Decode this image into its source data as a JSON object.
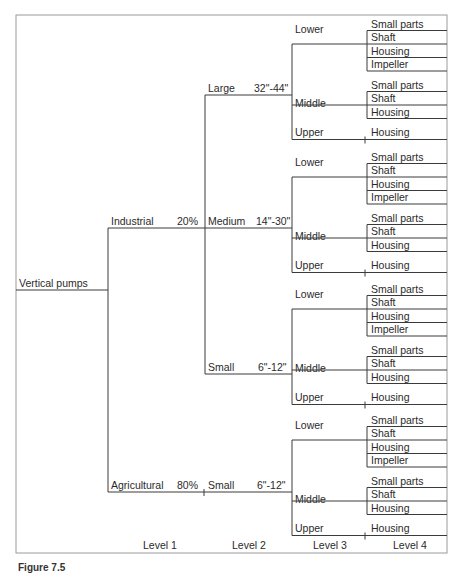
{
  "root": {
    "label": "Vertical pumps"
  },
  "level1": [
    {
      "label": "Industrial",
      "share": "20%"
    },
    {
      "label": "Agricultural",
      "share": "80%"
    }
  ],
  "level2": [
    {
      "parent": "Industrial",
      "label": "Large",
      "size": "32\"-44\""
    },
    {
      "parent": "Industrial",
      "label": "Medium",
      "size": "14\"-30\""
    },
    {
      "parent": "Industrial",
      "label": "Small",
      "size": "6\"-12\""
    },
    {
      "parent": "Agricultural",
      "label": "Small",
      "size": "6\"-12\""
    }
  ],
  "level3_sections": [
    {
      "label": "Lower",
      "parts": [
        "Small parts",
        "Shaft",
        "Housing",
        "Impeller"
      ]
    },
    {
      "label": "Middle",
      "parts": [
        "Small parts",
        "Shaft",
        "Housing"
      ]
    },
    {
      "label": "Upper",
      "parts": [
        "Housing"
      ]
    }
  ],
  "level_labels": [
    "Level 1",
    "Level 2",
    "Level 3",
    "Level 4"
  ],
  "caption": "Figure 7.5",
  "colors": {
    "line": "#3a3a3a",
    "frame": "#9a9a9a",
    "text": "#2a2a2a"
  }
}
